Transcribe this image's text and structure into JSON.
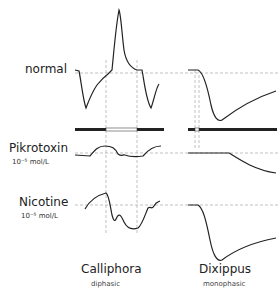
{
  "rows": [
    {
      "label": "normal",
      "concentration": ""
    },
    {
      "label": "Pikrotoxin",
      "concentration": "10⁻⁵ mol/L"
    },
    {
      "label": "Nicotine",
      "concentration": "10⁻⁵ mol/L"
    }
  ],
  "columns": [
    {
      "title": "Calliphora",
      "subtitle": "diphasic"
    },
    {
      "title": "Dixippus",
      "subtitle": "monophasic"
    }
  ],
  "colors": {
    "trace": "#222222",
    "guide": "#999999",
    "bar": "#222222"
  }
}
